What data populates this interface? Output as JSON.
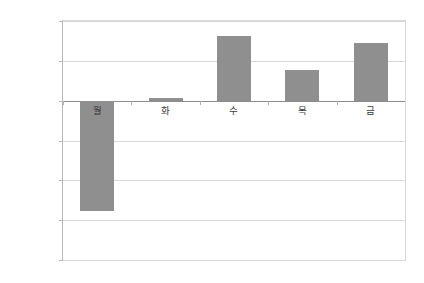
{
  "chart_data": {
    "type": "bar",
    "title": "",
    "subtitle": "",
    "xlabel": "",
    "ylabel": "",
    "categories": [
      "월",
      "화",
      "수",
      "목",
      "금"
    ],
    "values": [
      -0.139,
      0.003,
      0.081,
      0.038,
      0.072
    ],
    "value_unit": "%",
    "ylim": [
      -0.2,
      0.1
    ],
    "ytick_values": [
      0.1,
      0.05,
      0.0,
      -0.05,
      -0.1,
      -0.15,
      -0.2
    ],
    "ytick_labels": [
      "0.100%",
      "0.050%",
      "0.00%",
      "-0.050%",
      "-0.100%",
      "-0.150%",
      "-0.200%"
    ],
    "grid": true,
    "legend": false,
    "legend_position": "none",
    "series": [
      {
        "name": "",
        "values": [
          -0.139,
          0.003,
          0.081,
          0.038,
          0.072
        ]
      }
    ]
  },
  "style": {
    "bar_color": "#8f8f8f",
    "grid_color": "#d9d9d9",
    "zero_line_color": "#8c8c8c",
    "plot_border_color": "#d8d8d8",
    "axis_color": "#b8b8b8",
    "label_color": "#4d4d4d",
    "category_label_color": "#3a3a3a",
    "background_color": "#ffffff"
  }
}
